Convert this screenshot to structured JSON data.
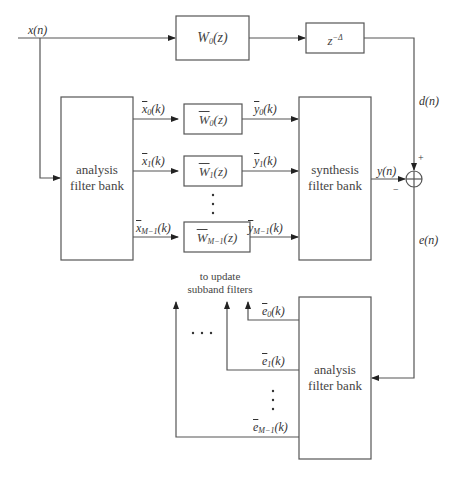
{
  "diagram": {
    "type": "subband adaptive filter block diagram",
    "inputs": {
      "x_n": "x(n)",
      "d_n": "d(n)",
      "y_n": "y(n)",
      "e_n": "e(n)"
    },
    "blocks": {
      "w0": {
        "label": "W",
        "sub": "0",
        "arg": "(z)"
      },
      "delay": {
        "label": "z",
        "sup": "−Δ"
      },
      "analysis_top": {
        "line1": "analysis",
        "line2": "filter bank"
      },
      "synthesis": {
        "line1": "synthesis",
        "line2": "filter bank"
      },
      "analysis_bottom": {
        "line1": "analysis",
        "line2": "filter bank"
      },
      "subband_filters": [
        {
          "label": "W",
          "sub": "0",
          "arg": "(z)"
        },
        {
          "label": "W",
          "sub": "1",
          "arg": "(z)"
        },
        {
          "label": "W",
          "sub": "M−1",
          "arg": "(z)"
        }
      ]
    },
    "signals": {
      "x_sub": [
        {
          "base": "x",
          "sub": "0",
          "arg": "(k)"
        },
        {
          "base": "x",
          "sub": "1",
          "arg": "(k)"
        },
        {
          "base": "x",
          "sub": "M−1",
          "arg": "(k)"
        }
      ],
      "y_sub": [
        {
          "base": "y",
          "sub": "0",
          "arg": "(k)"
        },
        {
          "base": "y",
          "sub": "1",
          "arg": "(k)"
        },
        {
          "base": "y",
          "sub": "M−1",
          "arg": "(k)"
        }
      ],
      "e_sub": [
        {
          "base": "e",
          "sub": "0",
          "arg": "(k)"
        },
        {
          "base": "e",
          "sub": "1",
          "arg": "(k)"
        },
        {
          "base": "e",
          "sub": "M−1",
          "arg": "(k)"
        }
      ]
    },
    "summer": {
      "plus": "+",
      "minus": "−"
    },
    "annotation": {
      "line1": "to update",
      "line2": "subband filters"
    },
    "ellipsis_vertical": "⋮",
    "ellipsis_horizontal": "· · ·"
  }
}
